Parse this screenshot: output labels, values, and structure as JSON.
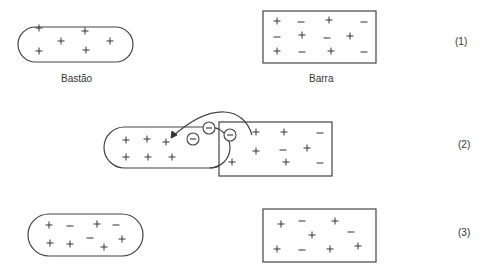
{
  "labels": {
    "rod": "Bastão",
    "bar": "Barra",
    "step1": "(1)",
    "step2": "(2)",
    "step3": "(3)"
  },
  "colors": {
    "stroke": "#444444",
    "text": "#333333",
    "background": "#ffffff"
  },
  "scenes": [
    {
      "id": 1,
      "rod": {
        "x": 18,
        "y": 27,
        "w": 115,
        "h": 35,
        "charges": [
          [
            "+",
            39,
            28
          ],
          [
            "+",
            85,
            31
          ],
          [
            "+",
            61,
            41
          ],
          [
            "+",
            110,
            41
          ],
          [
            "+",
            39,
            51
          ],
          [
            "+",
            86,
            50
          ]
        ]
      },
      "bar": {
        "x": 263,
        "y": 11,
        "w": 113,
        "h": 52,
        "charges": [
          [
            "+",
            277,
            21
          ],
          [
            "−",
            301,
            22
          ],
          [
            "+",
            329,
            20
          ],
          [
            "−",
            364,
            22
          ],
          [
            "−",
            277,
            37
          ],
          [
            "+",
            302,
            35
          ],
          [
            "−",
            327,
            38
          ],
          [
            "+",
            350,
            36
          ],
          [
            "+",
            277,
            51
          ],
          [
            "−",
            302,
            52
          ],
          [
            "+",
            331,
            51
          ],
          [
            "−",
            364,
            52
          ]
        ]
      }
    },
    {
      "id": 2,
      "rod": {
        "x": 104,
        "y": 127,
        "w": 126,
        "h": 41,
        "charges": [
          [
            "+",
            126,
            140
          ],
          [
            "+",
            147,
            139
          ],
          [
            "+",
            166,
            142
          ],
          [
            "+",
            126,
            157
          ],
          [
            "+",
            148,
            157
          ],
          [
            "+",
            172,
            157
          ]
        ]
      },
      "bar": {
        "x": 219,
        "y": 122,
        "w": 113,
        "h": 54,
        "charges": [
          [
            "+",
            256,
            132
          ],
          [
            "+",
            284,
            132
          ],
          [
            "−",
            320,
            133
          ],
          [
            "+",
            256,
            151
          ],
          [
            "−",
            283,
            150
          ],
          [
            "+",
            307,
            148
          ],
          [
            "+",
            232,
            162
          ],
          [
            "+",
            286,
            162
          ],
          [
            "−",
            320,
            163
          ]
        ]
      },
      "electrons": [
        [
          193,
          139
        ],
        [
          209,
          128
        ],
        [
          230,
          135
        ]
      ],
      "arrow": {
        "from": [
          252,
          135
        ],
        "to": [
          172,
          137
        ]
      }
    },
    {
      "id": 3,
      "rod": {
        "x": 28,
        "y": 214,
        "w": 115,
        "h": 42,
        "charges": [
          [
            "+",
            49,
            225
          ],
          [
            "−",
            70,
            226
          ],
          [
            "+",
            97,
            224
          ],
          [
            "−",
            116,
            225
          ],
          [
            "+",
            50,
            243
          ],
          [
            "+",
            70,
            244
          ],
          [
            "−",
            90,
            238
          ],
          [
            "+",
            104,
            247
          ],
          [
            "+",
            122,
            239
          ]
        ]
      },
      "bar": {
        "x": 263,
        "y": 209,
        "w": 113,
        "h": 53,
        "charges": [
          [
            "+",
            281,
            224
          ],
          [
            "−",
            302,
            221
          ],
          [
            "+",
            335,
            221
          ],
          [
            "+",
            312,
            235
          ],
          [
            "−",
            351,
            232
          ],
          [
            "+",
            277,
            249
          ],
          [
            "−",
            302,
            250
          ],
          [
            "+",
            330,
            249
          ],
          [
            "+",
            358,
            246
          ]
        ]
      }
    }
  ]
}
